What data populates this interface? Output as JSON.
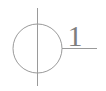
{
  "canvas": {
    "width": 106,
    "height": 91,
    "background_color": "#ffffff"
  },
  "diagram": {
    "type": "schematic-callout",
    "stroke_color": "#9a9a9a",
    "label_color": "#7e7e7e",
    "stroke_width": 1
  },
  "shapes": {
    "circle": {
      "name": "outline-circle",
      "center_x": 37.5,
      "center_y": 48.5,
      "radius": 24.5
    },
    "center_line": {
      "name": "vertical-center-line",
      "x": 37.5,
      "y_start": 8,
      "y_end": 86
    },
    "leader_line": {
      "name": "horizontal-leader-line",
      "y": 48.5,
      "x_start": 62,
      "x_end": 97
    }
  },
  "labels": {
    "callout": {
      "text": "1",
      "x": 75,
      "y": 46,
      "font_size": 30
    }
  }
}
